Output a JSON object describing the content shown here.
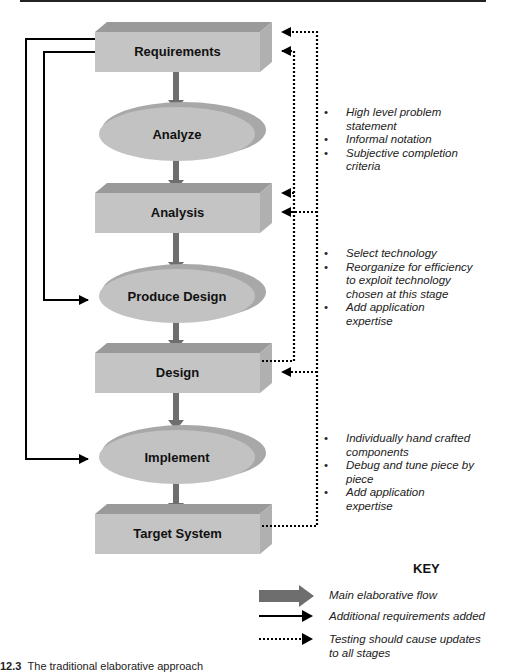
{
  "stages": [
    {
      "type": "box",
      "label": "Requirements"
    },
    {
      "type": "process",
      "label": "Analyze"
    },
    {
      "type": "box",
      "label": "Analysis"
    },
    {
      "type": "process",
      "label": "Produce Design"
    },
    {
      "type": "box",
      "label": "Design"
    },
    {
      "type": "process",
      "label": "Implement"
    },
    {
      "type": "box",
      "label": "Target System"
    }
  ],
  "notes": {
    "analyze": [
      "High level problem statement",
      "Informal notation",
      "Subjective completion criteria"
    ],
    "produce_design": [
      "Select technology",
      "Reorganize for efficiency to exploit technology chosen at this stage",
      "Add application expertise"
    ],
    "implement": [
      "Individually hand crafted components",
      "Debug and tune piece by piece",
      "Add application expertise"
    ]
  },
  "key": {
    "title": "KEY",
    "items": [
      {
        "icon": "thick-gray-arrow-icon",
        "label": "Main elaborative flow"
      },
      {
        "icon": "solid-arrow-icon",
        "label": "Additional requirements added"
      },
      {
        "icon": "dotted-arrow-icon",
        "label": "Testing should cause updates to all stages"
      }
    ]
  },
  "caption": {
    "number": "12.3",
    "text": "The traditional elaborative approach"
  },
  "colors": {
    "box_front": "#c4c4c4",
    "box_top": "#9a9a9a",
    "box_side": "#b0b0b0",
    "ellipse": "#c2c2c2",
    "ellipse_shadow": "#a8a8a8",
    "flow_arrow": "#6e6e6e",
    "line": "#000000"
  }
}
